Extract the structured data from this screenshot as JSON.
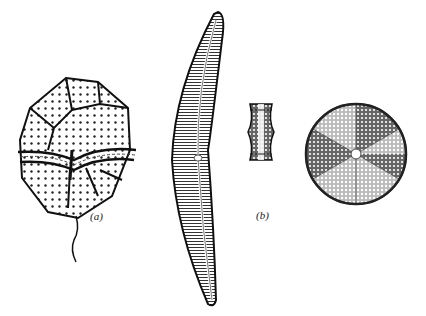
{
  "figure": {
    "labels": {
      "a": "(a)",
      "b": "(b)"
    },
    "organisms": [
      {
        "name": "dinoflagellate",
        "label": "(a)"
      },
      {
        "name": "pennate-diatom"
      },
      {
        "name": "diatom-girdle-view",
        "label": "(b)"
      },
      {
        "name": "centric-diatom"
      }
    ]
  }
}
